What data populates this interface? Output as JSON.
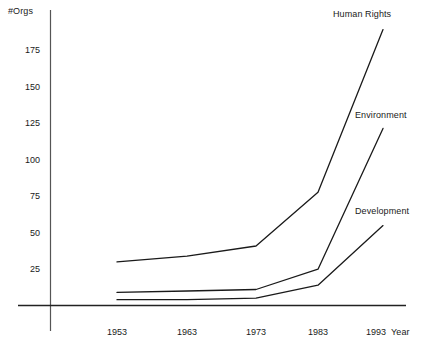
{
  "chart_data": {
    "type": "line",
    "title": "",
    "subtitle": "",
    "xlabel": "Year",
    "ylabel": "#Orgs",
    "x": [
      1953,
      1963,
      1973,
      1983,
      1993
    ],
    "categories": [
      "1953",
      "1963",
      "1973",
      "1983",
      "1993"
    ],
    "xlim": [
      1950,
      1995
    ],
    "ylim": [
      0,
      200
    ],
    "y_ticks": [
      25,
      50,
      75,
      100,
      125,
      150,
      175
    ],
    "y_tick_labels": [
      "25",
      "50",
      "75",
      "100",
      "125",
      "150",
      "175"
    ],
    "x_ticks": [
      1953,
      1963,
      1973,
      1983,
      1993
    ],
    "x_tick_labels": [
      "1953",
      "1963",
      "1973",
      "1983",
      "1993"
    ],
    "grid": false,
    "legend_position": "inline-right-end-of-line",
    "line_color": "#1a1a1a",
    "series": [
      {
        "name": "Human Rights",
        "values": [
          30,
          34,
          41,
          78,
          190
        ],
        "label_text": "Human Rights"
      },
      {
        "name": "Environment",
        "values": [
          9,
          10,
          11,
          25,
          122
        ],
        "label_text": "Environment"
      },
      {
        "name": "Development",
        "values": [
          4,
          4,
          5,
          14,
          55
        ],
        "label_text": "Development"
      }
    ]
  },
  "axes": {
    "y_title": "#Orgs",
    "x_title": "Year"
  },
  "ticks": {
    "y": [
      "175",
      "150",
      "125",
      "100",
      "75",
      "50",
      "25"
    ],
    "x": [
      "1953",
      "1963",
      "1973",
      "1983",
      "1993"
    ]
  },
  "series_labels": {
    "human_rights": "Human Rights",
    "environment": "Environment",
    "development": "Development"
  },
  "colors": {
    "line": "#1a1a1a",
    "axis": "#444444",
    "text": "#1a1a1a",
    "background": "#ffffff"
  }
}
